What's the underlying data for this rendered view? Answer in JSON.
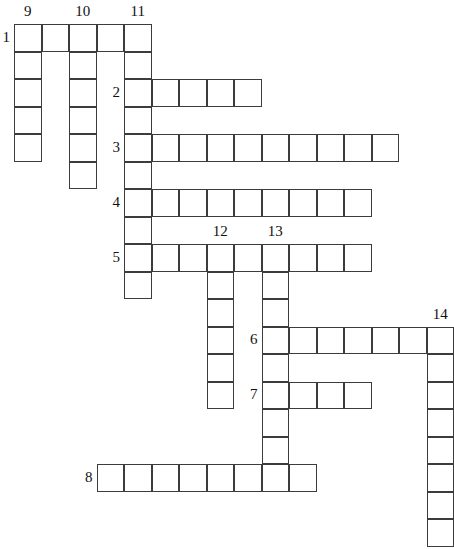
{
  "puzzle": {
    "title": "crossword-grid",
    "cell_size": 27.5,
    "origin": {
      "x": 14,
      "y": 24
    },
    "grid_columns": 16,
    "grid_rows": 17,
    "colors": {
      "cell_border": "#3c3c3c",
      "cell_fill": "#ffffff",
      "label_text": "#111111",
      "background": "#ffffff"
    },
    "across": [
      {
        "number": "1",
        "row": 0,
        "col_start": 0,
        "length": 5,
        "label_side": "left"
      },
      {
        "number": "2",
        "row": 2,
        "col_start": 4,
        "length": 5,
        "label_side": "left"
      },
      {
        "number": "3",
        "row": 4,
        "col_start": 4,
        "length": 10,
        "label_side": "left"
      },
      {
        "number": "4",
        "row": 6,
        "col_start": 4,
        "length": 9,
        "label_side": "left"
      },
      {
        "number": "5",
        "row": 8,
        "col_start": 4,
        "length": 9,
        "label_side": "left"
      },
      {
        "number": "6",
        "row": 11,
        "col_start": 9,
        "length": 7,
        "label_side": "left"
      },
      {
        "number": "7",
        "row": 13,
        "col_start": 9,
        "length": 4,
        "label_side": "left"
      },
      {
        "number": "8",
        "row": 16,
        "col_start": 3,
        "length": 8,
        "label_side": "left"
      }
    ],
    "down": [
      {
        "number": "9",
        "col": 0,
        "row_start": 0,
        "length": 5,
        "label_side": "top"
      },
      {
        "number": "10",
        "col": 2,
        "row_start": 0,
        "length": 6,
        "label_side": "top"
      },
      {
        "number": "11",
        "col": 4,
        "row_start": 0,
        "length": 10,
        "label_side": "top"
      },
      {
        "number": "12",
        "col": 7,
        "row_start": 8,
        "length": 6,
        "label_side": "top"
      },
      {
        "number": "13",
        "col": 9,
        "row_start": 8,
        "length": 9,
        "label_side": "top"
      },
      {
        "number": "14",
        "col": 15,
        "row_start": 11,
        "length": 8,
        "label_side": "top"
      }
    ]
  }
}
